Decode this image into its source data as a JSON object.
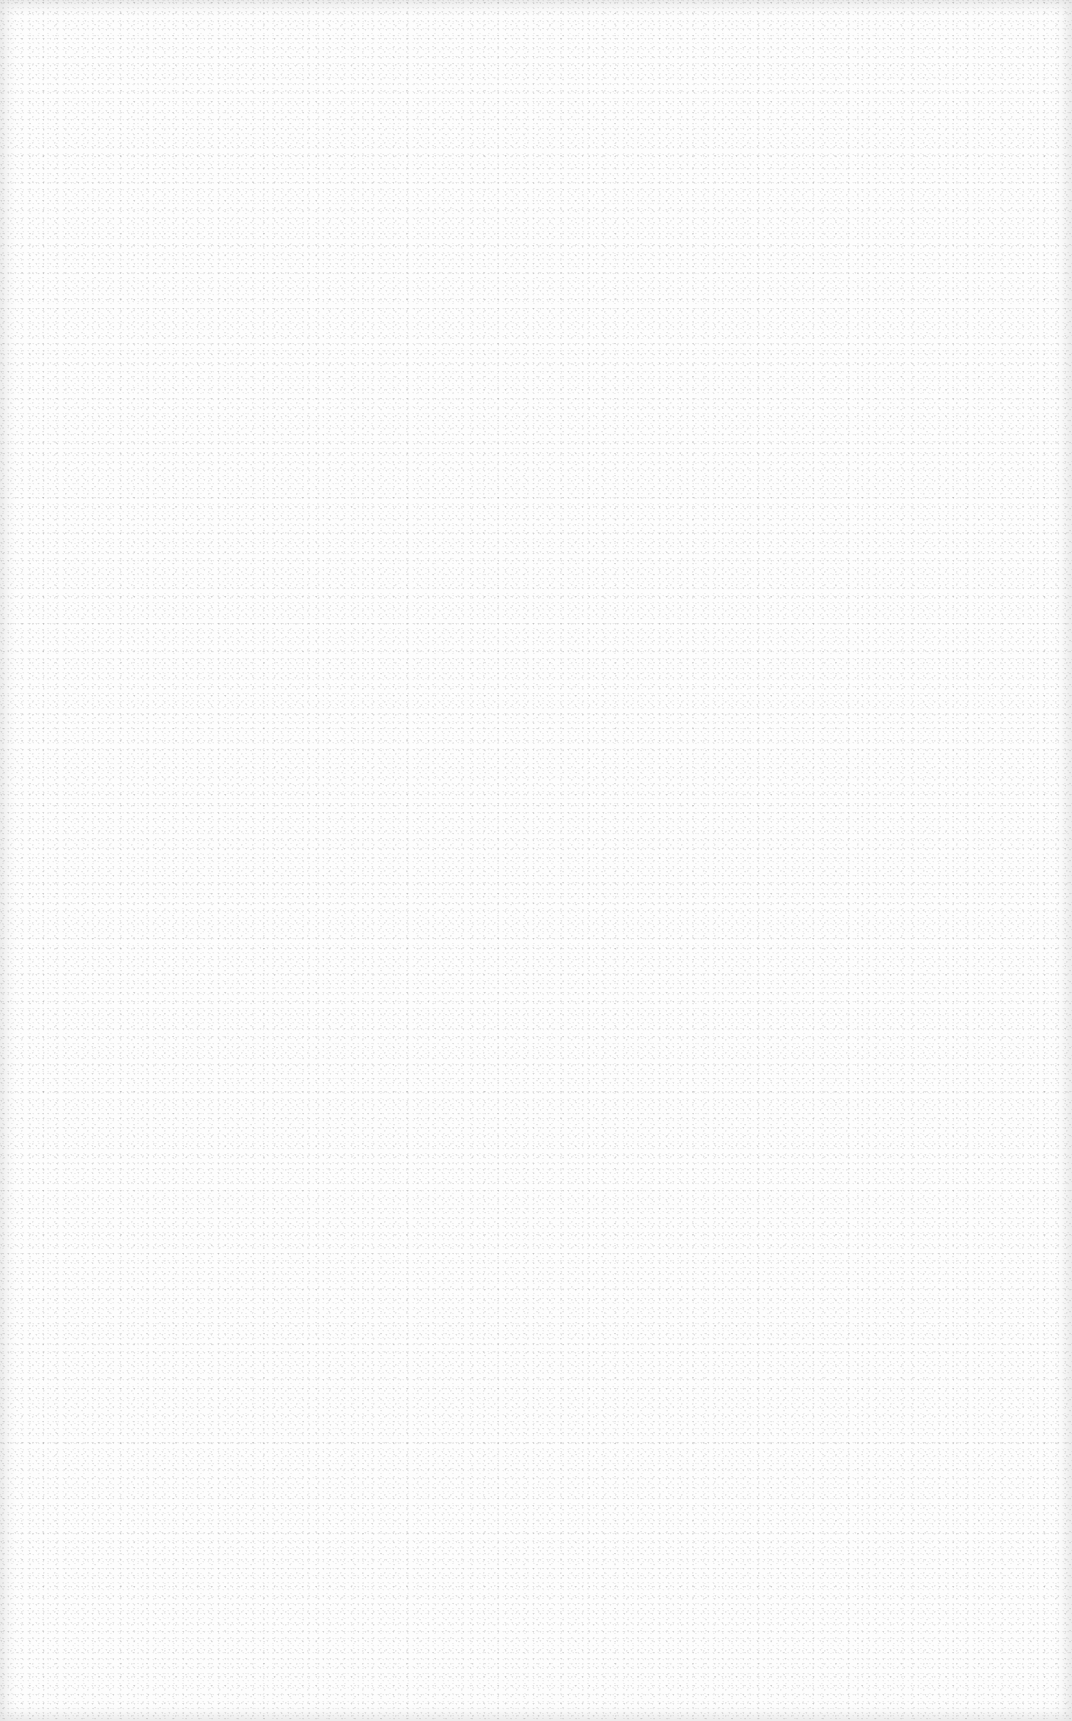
{
  "page": {
    "type": "blank-scanned-page",
    "background_color": "#fdfdfd",
    "texture": "paper-speckle-noise",
    "text_content": []
  }
}
